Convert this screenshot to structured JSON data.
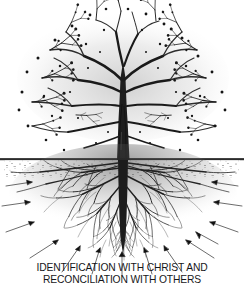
{
  "figure": {
    "background_color": "#ffffff",
    "ink_color": "#1a1a1a",
    "width": 244,
    "height": 285
  },
  "caption": {
    "line1": "IDENTIFICATION WITH CHRIST AND",
    "line2": "RECONCILIATION WITH OTHERS",
    "color": "#17171a",
    "alignment": "center"
  },
  "illustration": {
    "style": "pen-and-ink line drawing",
    "subject": "bare deciduous tree with extensive root system",
    "ground_line": {
      "label": "ground-line",
      "y": 159,
      "color": "#1a1a1a"
    },
    "canopy": {
      "label": "tree-canopy",
      "description": "leafless branching crown with buds at branch tips",
      "top": 8,
      "bottom": 158,
      "left": 14,
      "right": 232,
      "bud_count": 120
    },
    "trunk": {
      "label": "tree-trunk",
      "center_x": 123,
      "top": 60,
      "bottom": 160,
      "width_at_base": 11
    },
    "roots": {
      "label": "root-system",
      "description": "dense fibrous root mass spreading below ground",
      "top": 159,
      "bottom": 262,
      "left": 10,
      "right": 236
    },
    "arrows": {
      "label": "inward-pointing-arrows",
      "description": "thin arrows directed inward toward the root mass",
      "count": 14,
      "color": "#1a1a1a"
    }
  }
}
